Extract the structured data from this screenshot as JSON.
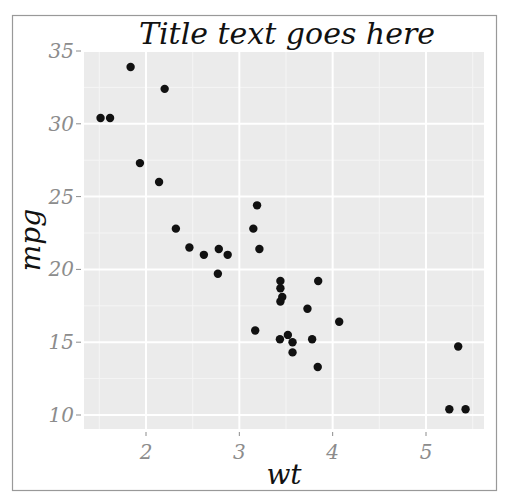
{
  "chart_data": {
    "type": "scatter",
    "title": "Title text goes here",
    "xlabel": "wt",
    "ylabel": "mpg",
    "xlim": [
      1.3,
      5.6
    ],
    "ylim": [
      9.1,
      35.0
    ],
    "x_ticks": [
      2,
      3,
      4,
      5
    ],
    "y_ticks": [
      10,
      15,
      20,
      25,
      30,
      35
    ],
    "x_tick_labels": [
      "2",
      "3",
      "4",
      "5"
    ],
    "y_tick_labels": [
      "10",
      "15",
      "20",
      "25",
      "30",
      "35"
    ],
    "grid": true,
    "legend": null,
    "points": [
      {
        "x": 2.62,
        "y": 21.0
      },
      {
        "x": 2.875,
        "y": 21.0
      },
      {
        "x": 2.32,
        "y": 22.8
      },
      {
        "x": 3.215,
        "y": 21.4
      },
      {
        "x": 3.44,
        "y": 18.7
      },
      {
        "x": 3.46,
        "y": 18.1
      },
      {
        "x": 3.57,
        "y": 14.3
      },
      {
        "x": 3.19,
        "y": 24.4
      },
      {
        "x": 3.15,
        "y": 22.8
      },
      {
        "x": 3.44,
        "y": 19.2
      },
      {
        "x": 3.44,
        "y": 17.8
      },
      {
        "x": 4.07,
        "y": 16.4
      },
      {
        "x": 3.73,
        "y": 17.3
      },
      {
        "x": 3.78,
        "y": 15.2
      },
      {
        "x": 5.25,
        "y": 10.4
      },
      {
        "x": 5.424,
        "y": 10.4
      },
      {
        "x": 5.345,
        "y": 14.7
      },
      {
        "x": 2.2,
        "y": 32.4
      },
      {
        "x": 1.615,
        "y": 30.4
      },
      {
        "x": 1.835,
        "y": 33.9
      },
      {
        "x": 2.465,
        "y": 21.5
      },
      {
        "x": 3.52,
        "y": 15.5
      },
      {
        "x": 3.435,
        "y": 15.2
      },
      {
        "x": 3.84,
        "y": 13.3
      },
      {
        "x": 3.845,
        "y": 19.2
      },
      {
        "x": 1.935,
        "y": 27.3
      },
      {
        "x": 2.14,
        "y": 26.0
      },
      {
        "x": 1.513,
        "y": 30.4
      },
      {
        "x": 3.17,
        "y": 15.8
      },
      {
        "x": 2.77,
        "y": 19.7
      },
      {
        "x": 3.57,
        "y": 15.0
      },
      {
        "x": 2.78,
        "y": 21.4
      }
    ],
    "colors": {
      "panel": "#ebebeb",
      "grid_major": "#ffffff",
      "grid_minor": "#f5f5f5",
      "point": "#111111",
      "tick_label": "#8c8c8c",
      "frame": "#999999"
    }
  }
}
